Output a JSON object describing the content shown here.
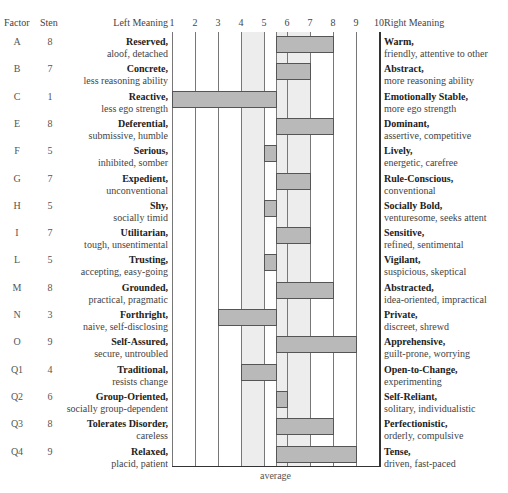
{
  "header": {
    "factor": "Factor",
    "sten": "Sten",
    "left_meaning": "Left Meaning",
    "right_meaning": "Right Meaning"
  },
  "axis": {
    "ticks": [
      "1",
      "2",
      "3",
      "4",
      "5",
      "6",
      "7",
      "8",
      "9",
      "10"
    ],
    "average_label": "average"
  },
  "rows": [
    {
      "factor": "A",
      "sten": "8",
      "left_bold": "Reserved,",
      "left_sub": "aloof, detached",
      "right_bold": "Warm,",
      "right_sub": "friendly, attentive to other"
    },
    {
      "factor": "B",
      "sten": "7",
      "left_bold": "Concrete,",
      "left_sub": "less reasoning ability",
      "right_bold": "Abstract,",
      "right_sub": "more reasoning ability"
    },
    {
      "factor": "C",
      "sten": "1",
      "left_bold": "Reactive,",
      "left_sub": "less ego strength",
      "right_bold": "Emotionally Stable,",
      "right_sub": "more ego strength"
    },
    {
      "factor": "E",
      "sten": "8",
      "left_bold": "Deferential,",
      "left_sub": "submissive, humble",
      "right_bold": "Dominant,",
      "right_sub": "assertive, competitive"
    },
    {
      "factor": "F",
      "sten": "5",
      "left_bold": "Serious,",
      "left_sub": "inhibited, somber",
      "right_bold": "Lively,",
      "right_sub": "energetic, carefree"
    },
    {
      "factor": "G",
      "sten": "7",
      "left_bold": "Expedient,",
      "left_sub": "unconventional",
      "right_bold": "Rule-Conscious,",
      "right_sub": "conventional"
    },
    {
      "factor": "H",
      "sten": "5",
      "left_bold": "Shy,",
      "left_sub": "socially timid",
      "right_bold": "Socially Bold,",
      "right_sub": "venturesome, seeks attent"
    },
    {
      "factor": "I",
      "sten": "7",
      "left_bold": "Utilitarian,",
      "left_sub": "tough, unsentimental",
      "right_bold": "Sensitive,",
      "right_sub": "refined, sentimental"
    },
    {
      "factor": "L",
      "sten": "5",
      "left_bold": "Trusting,",
      "left_sub": "accepting, easy-going",
      "right_bold": "Vigilant,",
      "right_sub": "suspicious, skeptical"
    },
    {
      "factor": "M",
      "sten": "8",
      "left_bold": "Grounded,",
      "left_sub": "practical, pragmatic",
      "right_bold": "Abstracted,",
      "right_sub": "idea-oriented, impractical"
    },
    {
      "factor": "N",
      "sten": "3",
      "left_bold": "Forthright,",
      "left_sub": "naive, self-disclosing",
      "right_bold": "Private,",
      "right_sub": "discreet, shrewd"
    },
    {
      "factor": "O",
      "sten": "9",
      "left_bold": "Self-Assured,",
      "left_sub": "secure, untroubled",
      "right_bold": "Apprehensive,",
      "right_sub": "guilt-prone, worrying"
    },
    {
      "factor": "Q1",
      "sten": "4",
      "left_bold": "Traditional,",
      "left_sub": "resists change",
      "right_bold": "Open-to-Change,",
      "right_sub": "experimenting"
    },
    {
      "factor": "Q2",
      "sten": "6",
      "left_bold": "Group-Oriented,",
      "left_sub": "socially group-dependent",
      "right_bold": "Self-Reliant,",
      "right_sub": "solitary, individualistic"
    },
    {
      "factor": "Q3",
      "sten": "8",
      "left_bold": "Tolerates Disorder,",
      "left_sub": "careless",
      "right_bold": "Perfectionistic,",
      "right_sub": "orderly, compulsive"
    },
    {
      "factor": "Q4",
      "sten": "9",
      "left_bold": "Relaxed,",
      "left_sub": "placid, patient",
      "right_bold": "Tense,",
      "right_sub": "driven, fast-paced"
    }
  ],
  "colors": {
    "bar_fill": "#b9b9b9",
    "bar_border": "#555555",
    "grid": "#777777",
    "average_band": "#ededed"
  },
  "chart_data": {
    "type": "bar",
    "orientation": "horizontal",
    "title": "",
    "xlabel": "average",
    "ylabel": "Factor",
    "baseline": 5.5,
    "xlim": [
      1,
      10
    ],
    "grid": true,
    "categories": [
      "A",
      "B",
      "C",
      "E",
      "F",
      "G",
      "H",
      "I",
      "L",
      "M",
      "N",
      "O",
      "Q1",
      "Q2",
      "Q3",
      "Q4"
    ],
    "values": [
      8,
      7,
      1,
      8,
      5,
      7,
      5,
      7,
      5,
      8,
      3,
      9,
      4,
      6,
      8,
      9
    ],
    "tick_labels": [
      "1",
      "2",
      "3",
      "4",
      "5",
      "6",
      "7",
      "8",
      "9",
      "10"
    ],
    "left_labels": [
      "Reserved",
      "Concrete",
      "Reactive",
      "Deferential",
      "Serious",
      "Expedient",
      "Shy",
      "Utilitarian",
      "Trusting",
      "Grounded",
      "Forthright",
      "Self-Assured",
      "Traditional",
      "Group-Oriented",
      "Tolerates Disorder",
      "Relaxed"
    ],
    "right_labels": [
      "Warm",
      "Abstract",
      "Emotionally Stable",
      "Dominant",
      "Lively",
      "Rule-Conscious",
      "Socially Bold",
      "Sensitive",
      "Vigilant",
      "Abstracted",
      "Private",
      "Apprehensive",
      "Open-to-Change",
      "Self-Reliant",
      "Perfectionistic",
      "Tense"
    ],
    "average_band": [
      4,
      7
    ]
  }
}
